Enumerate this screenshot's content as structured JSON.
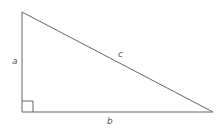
{
  "diagram": {
    "stroke_color": "#666666",
    "labels": {
      "a": "a",
      "b": "b",
      "c": "c"
    },
    "vertices": {
      "top": [
        22,
        12
      ],
      "right_angle": [
        22,
        112
      ],
      "right": [
        213,
        112
      ]
    },
    "right_angle_marker_size": 11
  }
}
